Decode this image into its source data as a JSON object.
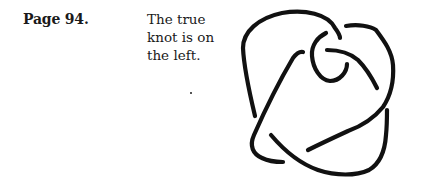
{
  "page": {
    "label": "Page 94.",
    "answer_lines": [
      "The true",
      "knot is on",
      "the left."
    ]
  },
  "figure": {
    "type": "knot-diagram",
    "stroke_color": "#111111"
  }
}
